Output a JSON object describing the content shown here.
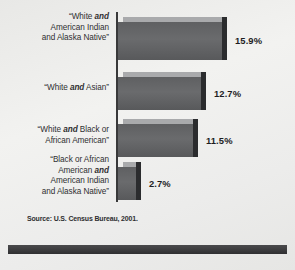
{
  "figure": {
    "background_color": "#ededeb",
    "bar_color": "#636466",
    "bar_top_color": "#a9aaac",
    "bar_side_color": "#2b2c2e",
    "axis_color": "#39393a",
    "footer_rule_color": "#3c3c3e",
    "source_note": "Source: U.S. Census Bureau, 2001."
  },
  "chart_data": {
    "type": "bar",
    "orientation": "horizontal",
    "title": "",
    "subtitle": "",
    "xlabel": "",
    "ylabel": "",
    "grid": false,
    "legend": "none",
    "value_suffix": "%",
    "xlim": [
      0,
      18
    ],
    "source": "Source: U.S. Census Bureau, 2001.",
    "categories": [
      "“White and American Indian and Alaska Native”",
      "“White and Asian”",
      "“White and Black or African American”",
      "“Black or African American and American Indian and Alaska Native”"
    ],
    "values": [
      15.9,
      12.7,
      11.5,
      2.7
    ],
    "value_labels": [
      "15.9%",
      "12.7%",
      "11.5%",
      "2.7%"
    ],
    "bars": [
      {
        "value": 15.9,
        "value_label": "15.9%",
        "label_lines": [
          [
            {
              "t": "“White ",
              "b": false
            },
            {
              "t": "and",
              "b": true
            }
          ],
          [
            {
              "t": "American Indian",
              "b": false
            }
          ],
          [
            {
              "t": "and Alaska Native”",
              "b": false
            }
          ]
        ]
      },
      {
        "value": 12.7,
        "value_label": "12.7%",
        "label_lines": [
          [
            {
              "t": "“White ",
              "b": false
            },
            {
              "t": "and",
              "b": true
            },
            {
              "t": " Asian”",
              "b": false
            }
          ]
        ]
      },
      {
        "value": 11.5,
        "value_label": "11.5%",
        "label_lines": [
          [
            {
              "t": "“White ",
              "b": false
            },
            {
              "t": "and",
              "b": true
            },
            {
              "t": " Black or",
              "b": false
            }
          ],
          [
            {
              "t": "African American”",
              "b": false
            }
          ]
        ]
      },
      {
        "value": 2.7,
        "value_label": "2.7%",
        "label_lines": [
          [
            {
              "t": "“Black or African",
              "b": false
            }
          ],
          [
            {
              "t": "American ",
              "b": false
            },
            {
              "t": "and",
              "b": true
            }
          ],
          [
            {
              "t": "American Indian",
              "b": false
            }
          ],
          [
            {
              "t": "and Alaska Native”",
              "b": false
            }
          ]
        ]
      }
    ]
  }
}
